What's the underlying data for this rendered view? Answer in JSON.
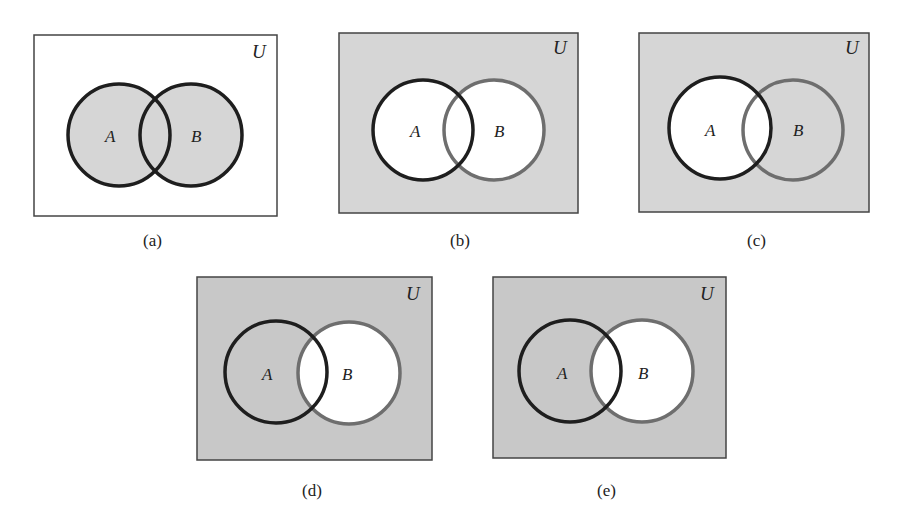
{
  "colors": {
    "shade": "#d6d6d6",
    "shade_dark": "#c4c4c4",
    "white": "#ffffff",
    "outline_black": "#1e1e1e",
    "outline_gray": "#6e6e6e",
    "frame": "#444444"
  },
  "labels": {
    "universe": "U",
    "set_a": "A",
    "set_b": "B"
  },
  "panels": [
    {
      "id": "a",
      "caption": "(a)",
      "shaded_region": "A ∪ B",
      "b_outline": "black"
    },
    {
      "id": "b",
      "caption": "(b)",
      "shaded_region": "(A ∪ B)′",
      "b_outline": "gray"
    },
    {
      "id": "c",
      "caption": "(c)",
      "shaded_region": "A′",
      "b_outline": "gray"
    },
    {
      "id": "d",
      "caption": "(d)",
      "shaded_region": "B′",
      "b_outline": "gray"
    },
    {
      "id": "e",
      "caption": "(e)",
      "shaded_region": "B′",
      "b_outline": "gray"
    }
  ]
}
